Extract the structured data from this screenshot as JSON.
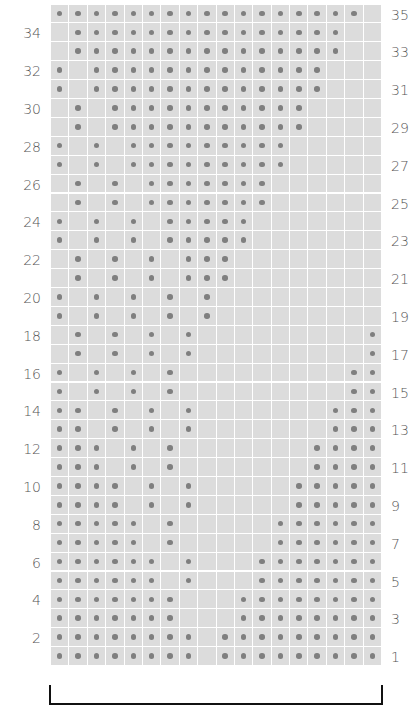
{
  "chart_data": {
    "type": "table",
    "title": "",
    "columns": 18,
    "rows_visible": 35,
    "row_order": "bottom-to-top",
    "left_labels": [
      "2",
      "4",
      "6",
      "8",
      "10",
      "12",
      "14",
      "16",
      "18",
      "20",
      "22",
      "24",
      "26",
      "28",
      "30",
      "32",
      "34"
    ],
    "right_labels": [
      "1",
      "3",
      "5",
      "7",
      "9",
      "11",
      "13",
      "15",
      "17",
      "19",
      "21",
      "23",
      "25",
      "27",
      "29",
      "31",
      "33",
      "35"
    ],
    "colors": {
      "cell": "#dcdcdc",
      "dot": "#7f7f7f",
      "gridline": "#ffffff",
      "label": "#555555",
      "bracket": "#111111"
    },
    "dots_by_row": {
      "1": [
        1,
        2,
        3,
        4,
        5,
        6,
        7,
        8,
        10,
        11,
        12,
        13,
        14,
        15,
        16,
        17,
        18
      ],
      "2": [
        1,
        2,
        3,
        4,
        5,
        6,
        7,
        8,
        10,
        11,
        12,
        13,
        14,
        15,
        16,
        17,
        18
      ],
      "3": [
        1,
        2,
        3,
        4,
        5,
        6,
        7,
        11,
        12,
        13,
        14,
        15,
        16,
        17,
        18
      ],
      "4": [
        1,
        2,
        3,
        4,
        5,
        6,
        7,
        11,
        12,
        13,
        14,
        15,
        16,
        17,
        18
      ],
      "5": [
        1,
        2,
        3,
        4,
        5,
        6,
        8,
        12,
        13,
        14,
        15,
        16,
        17,
        18
      ],
      "6": [
        1,
        2,
        3,
        4,
        5,
        6,
        8,
        12,
        13,
        14,
        15,
        16,
        17,
        18
      ],
      "7": [
        1,
        2,
        3,
        4,
        5,
        7,
        13,
        14,
        15,
        16,
        17,
        18
      ],
      "8": [
        1,
        2,
        3,
        4,
        5,
        7,
        13,
        14,
        15,
        16,
        17,
        18
      ],
      "9": [
        1,
        2,
        3,
        4,
        6,
        8,
        14,
        15,
        16,
        17,
        18
      ],
      "10": [
        1,
        2,
        3,
        4,
        6,
        8,
        14,
        15,
        16,
        17,
        18
      ],
      "11": [
        1,
        2,
        3,
        5,
        7,
        15,
        16,
        17,
        18
      ],
      "12": [
        1,
        2,
        3,
        5,
        7,
        15,
        16,
        17,
        18
      ],
      "13": [
        1,
        2,
        4,
        6,
        8,
        16,
        17,
        18
      ],
      "14": [
        1,
        2,
        4,
        6,
        8,
        16,
        17,
        18
      ],
      "15": [
        1,
        3,
        5,
        7,
        17,
        18
      ],
      "16": [
        1,
        3,
        5,
        7,
        17,
        18
      ],
      "17": [
        2,
        4,
        6,
        8,
        18
      ],
      "18": [
        2,
        4,
        6,
        8,
        18
      ],
      "19": [
        1,
        3,
        5,
        7,
        9
      ],
      "20": [
        1,
        3,
        5,
        7,
        9
      ],
      "21": [
        2,
        4,
        6,
        8,
        9,
        10
      ],
      "22": [
        2,
        4,
        6,
        8,
        9,
        10
      ],
      "23": [
        1,
        3,
        5,
        7,
        8,
        9,
        10,
        11
      ],
      "24": [
        1,
        3,
        5,
        7,
        8,
        9,
        10,
        11
      ],
      "25": [
        2,
        4,
        6,
        7,
        8,
        9,
        10,
        11,
        12
      ],
      "26": [
        2,
        4,
        6,
        7,
        8,
        9,
        10,
        11,
        12
      ],
      "27": [
        1,
        3,
        5,
        6,
        7,
        8,
        9,
        10,
        11,
        12,
        13
      ],
      "28": [
        1,
        3,
        5,
        6,
        7,
        8,
        9,
        10,
        11,
        12,
        13
      ],
      "29": [
        2,
        4,
        5,
        6,
        7,
        8,
        9,
        10,
        11,
        12,
        13,
        14
      ],
      "30": [
        2,
        4,
        5,
        6,
        7,
        8,
        9,
        10,
        11,
        12,
        13,
        14
      ],
      "31": [
        1,
        3,
        4,
        5,
        6,
        7,
        8,
        9,
        10,
        11,
        12,
        13,
        14,
        15
      ],
      "32": [
        1,
        3,
        4,
        5,
        6,
        7,
        8,
        9,
        10,
        11,
        12,
        13,
        14,
        15
      ],
      "33": [
        2,
        3,
        4,
        5,
        6,
        7,
        8,
        9,
        10,
        11,
        12,
        13,
        14,
        15,
        16
      ],
      "34": [
        2,
        3,
        4,
        5,
        6,
        7,
        8,
        9,
        10,
        11,
        12,
        13,
        14,
        15,
        16
      ],
      "35": [
        1,
        2,
        3,
        4,
        5,
        6,
        7,
        8,
        9,
        10,
        11,
        12,
        13,
        14,
        15,
        16,
        17
      ]
    },
    "repeat_bracket": {
      "from_column": 1,
      "to_column": 18
    }
  }
}
